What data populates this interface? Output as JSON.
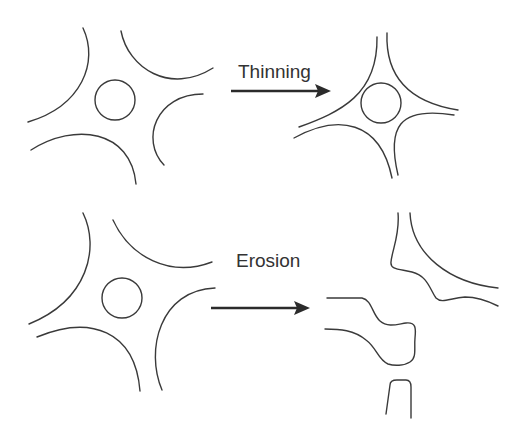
{
  "diagram": {
    "type": "process-comparison",
    "colors": {
      "line": "#3a3a3a",
      "text": "#333333",
      "arrow": "#2b2b2b",
      "background": "#ffffff"
    },
    "rows": [
      {
        "id": "thinning",
        "label": "Thinning",
        "from": "four concave grains surrounding a circular pore",
        "to": "grains pulled together; thin flanks, circular pore retained"
      },
      {
        "id": "erosion",
        "label": "Erosion",
        "from": "four concave grains surrounding a circular pore",
        "to": "eroded, irregular fragments; pore no longer circular"
      }
    ]
  }
}
